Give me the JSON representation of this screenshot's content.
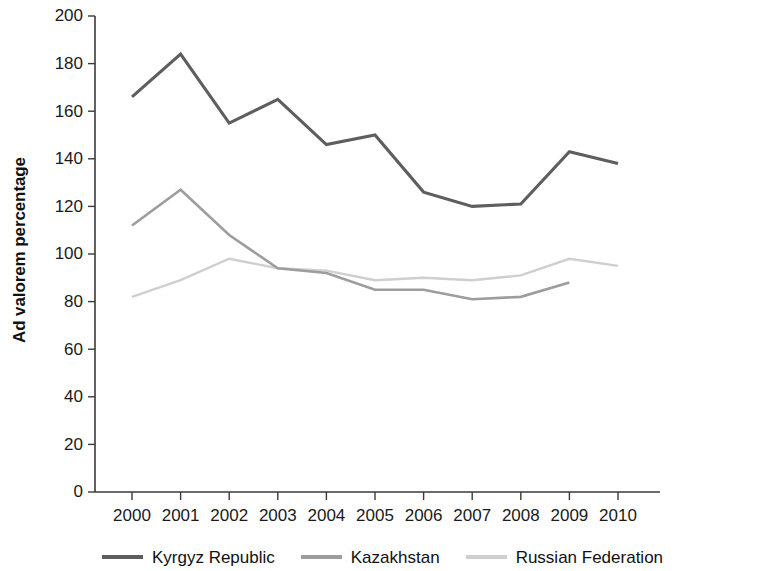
{
  "chart_data": {
    "type": "line",
    "title": "",
    "xlabel": "",
    "ylabel": "Ad valorem percentage",
    "categories": [
      "2000",
      "2001",
      "2002",
      "2003",
      "2004",
      "2005",
      "2006",
      "2007",
      "2008",
      "2009",
      "2010"
    ],
    "x": [
      2000,
      2001,
      2002,
      2003,
      2004,
      2005,
      2006,
      2007,
      2008,
      2009,
      2010
    ],
    "ylim": [
      0,
      200
    ],
    "yticks": [
      0,
      20,
      40,
      60,
      80,
      100,
      120,
      140,
      160,
      180,
      200
    ],
    "ytick_labels": [
      "0",
      "20",
      "40",
      "60",
      "80",
      "100",
      "120",
      "140",
      "160",
      "180",
      "200"
    ],
    "grid": false,
    "legend_position": "bottom",
    "series": [
      {
        "name": "Kyrgyz Republic",
        "color": "#5e5e5e",
        "width": 3.1,
        "values": [
          166,
          184,
          155,
          165,
          146,
          150,
          126,
          120,
          121,
          143,
          138
        ]
      },
      {
        "name": "Kazakhstan",
        "color": "#9d9d9d",
        "width": 2.6,
        "values": [
          112,
          127,
          108,
          94,
          92,
          85,
          85,
          81,
          82,
          88,
          null
        ]
      },
      {
        "name": "Russian Federation",
        "color": "#cfcfcf",
        "width": 2.4,
        "values": [
          82,
          89,
          98,
          94,
          93,
          89,
          90,
          89,
          91,
          98,
          95
        ]
      }
    ]
  },
  "legend": {
    "items": [
      {
        "label": "Kyrgyz Republic",
        "color": "#5e5e5e"
      },
      {
        "label": "Kazakhstan",
        "color": "#9d9d9d"
      },
      {
        "label": "Russian Federation",
        "color": "#cfcfcf"
      }
    ]
  },
  "axes": {
    "y_title": "Ad valorem percentage"
  }
}
